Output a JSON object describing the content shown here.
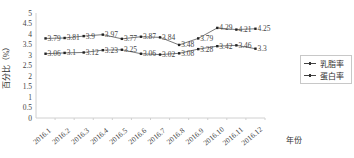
{
  "chart_data": {
    "type": "line",
    "title": "",
    "xlabel": "年份",
    "ylabel": "百分比（%）",
    "categories": [
      "2016.1",
      "2016.2",
      "2016.3",
      "2016.4",
      "2016.5",
      "2016.6",
      "2016.7",
      "2016.8",
      "2016.9",
      "2016.10",
      "2016.11",
      "2016.12"
    ],
    "series": [
      {
        "name": "乳脂率",
        "values": [
          3.79,
          3.81,
          3.9,
          3.97,
          3.77,
          3.87,
          3.84,
          3.48,
          3.79,
          4.29,
          4.21,
          4.25
        ]
      },
      {
        "name": "蛋白率",
        "values": [
          3.06,
          3.1,
          3.12,
          3.23,
          3.25,
          3.06,
          3.02,
          3.08,
          3.28,
          3.42,
          3.46,
          3.3
        ]
      }
    ],
    "ylim": [
      0,
      5
    ],
    "yticks": [
      "0",
      "0.5",
      "1",
      "1.5",
      "2",
      "2.5",
      "3",
      "3.5",
      "4",
      "4.5",
      "5"
    ],
    "grid": false,
    "data_labels": true,
    "legend_position": "right"
  },
  "legend": {
    "items": [
      {
        "label": "乳脂率"
      },
      {
        "label": "蛋白率"
      }
    ]
  }
}
